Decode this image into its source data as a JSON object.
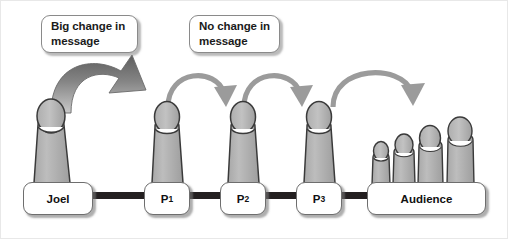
{
  "diagram": {
    "background_color": "#ffffff",
    "figure_fill": "#b3b3b3",
    "figure_stroke": "#3a3a3a",
    "connector_color": "#231f20",
    "thick_arrow_color": "#6e6e6e",
    "thin_arrow_color": "#9b9b9b",
    "callouts": [
      {
        "id": "big-change",
        "line1": "Big change in",
        "line2": "message"
      },
      {
        "id": "no-change",
        "line1": "No change in",
        "line2": "message"
      }
    ],
    "nodes": [
      {
        "id": "joel",
        "label": "Joel",
        "sub": ""
      },
      {
        "id": "p1",
        "label": "P",
        "sub": "1"
      },
      {
        "id": "p2",
        "label": "P",
        "sub": "2"
      },
      {
        "id": "p3",
        "label": "P",
        "sub": "3"
      },
      {
        "id": "audience",
        "label": "Audience",
        "sub": ""
      }
    ],
    "arrows": [
      {
        "id": "arrow-joel-to-p1",
        "from": "joel",
        "to": "p1",
        "style": "thick",
        "meaning": "Big change in message"
      },
      {
        "id": "arrow-p1-to-p2",
        "from": "p1",
        "to": "p2",
        "style": "thin",
        "meaning": "No change in message"
      },
      {
        "id": "arrow-p2-to-p3",
        "from": "p2",
        "to": "p3",
        "style": "thin",
        "meaning": "No change in message"
      },
      {
        "id": "arrow-p3-to-audience",
        "from": "p3",
        "to": "audience",
        "style": "thin",
        "meaning": "No change in message"
      }
    ],
    "connectors": [
      {
        "id": "connector-joel-p1",
        "from": "joel",
        "to": "p1"
      },
      {
        "id": "connector-p1-p2",
        "from": "p1",
        "to": "p2"
      },
      {
        "id": "connector-p2-p3",
        "from": "p2",
        "to": "p3"
      },
      {
        "id": "connector-p3-audience",
        "from": "p3",
        "to": "audience"
      }
    ],
    "audience_figure_count": 4
  }
}
